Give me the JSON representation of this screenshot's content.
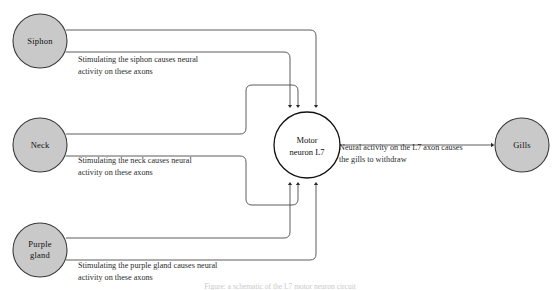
{
  "figure": {
    "caption": "Figure: a schematic of the L7 motor neuron circuit",
    "colors": {
      "node_fill": "#c9c9c9",
      "node_stroke": "#3a3a3a",
      "neuron_fill": "#ffffff",
      "neuron_stroke": "#111111",
      "wire": "#4a4a4a",
      "background": "#ffffff",
      "annotation_text": "#2b2b2b",
      "caption_text": "#c9c9c9"
    }
  },
  "nodes": {
    "siphon": {
      "label": "Siphon",
      "cx": 40,
      "cy": 41,
      "r": 27
    },
    "neck": {
      "label": "Neck",
      "cx": 40,
      "cy": 145,
      "r": 27
    },
    "purple_gland": {
      "label_line1": "Purple",
      "label_line2": "gland",
      "cx": 40,
      "cy": 250,
      "r": 27
    },
    "motor_neuron": {
      "label_line1": "Motor",
      "label_line2": "neuron L7",
      "cx": 307,
      "cy": 145,
      "r": 33
    },
    "gills": {
      "label": "Gills",
      "cx": 522,
      "cy": 145,
      "r": 27
    }
  },
  "annotations": {
    "siphon": {
      "line1": "Stimulating the siphon causes neural",
      "line2": "activity on these axons",
      "x": 78,
      "y": 62
    },
    "neck": {
      "line1": "Stimulating the neck causes neural",
      "line2": "activity on these axons",
      "x": 78,
      "y": 163
    },
    "purple_gland": {
      "line1": "Stimulating the purple gland causes neural",
      "line2": "activity on these axons",
      "x": 78,
      "y": 268
    },
    "output": {
      "line1": "Neural activity on the L7 axon causes",
      "line2": "the gills to withdraw",
      "x": 339,
      "y": 150
    }
  },
  "connections": {
    "siphon_axon_count": 2,
    "neck_axon_count": 2,
    "purple_gland_axon_count": 2,
    "inputs_top": 4,
    "inputs_bottom": 4,
    "output_axon_count": 1,
    "output_target": "Gills"
  }
}
